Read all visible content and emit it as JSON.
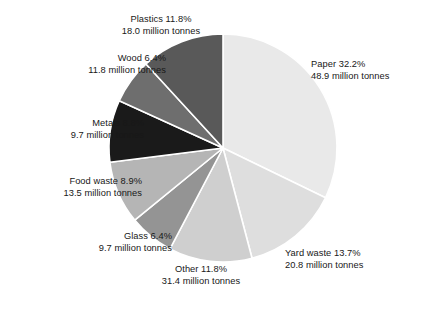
{
  "chart_data": {
    "type": "pie",
    "title": "",
    "subtitle": "",
    "xlabel": "",
    "ylabel": "",
    "units": "million tonnes",
    "legend_position": "none",
    "labels_position": "outside-callout",
    "grid": false,
    "start_angle_deg": 0,
    "direction": "clockwise",
    "center": {
      "x": 223,
      "y": 148
    },
    "radius": 114,
    "categories": [
      "Paper",
      "Yard waste",
      "Other",
      "Glass",
      "Food waste",
      "Metals",
      "Wood",
      "Plastics"
    ],
    "values": [
      32.2,
      13.7,
      11.8,
      6.4,
      8.9,
      8.8,
      6.4,
      11.8
    ],
    "value_unit": "percent",
    "absolute_values": [
      48.9,
      20.8,
      31.4,
      9.7,
      13.5,
      9.7,
      11.8,
      18.0
    ],
    "colors": [
      "#e9e9e9",
      "#dedede",
      "#cfcfcf",
      "#949494",
      "#b5b5b5",
      "#1a1a1a",
      "#6e6e6e",
      "#595959"
    ],
    "slices": [
      {
        "key": "paper",
        "name": "Paper",
        "percent": "32.2%",
        "label_line_1": "Paper 32.2%",
        "label_line_2": "48.9 million tonnes",
        "value": 32.2,
        "tonnes": 48.9,
        "color": "#e9e9e9",
        "align": "left"
      },
      {
        "key": "yard-waste",
        "name": "Yard waste",
        "percent": "13.7%",
        "label_line_1": "Yard waste 13.7%",
        "label_line_2": "20.8 million tonnes",
        "value": 13.7,
        "tonnes": 20.8,
        "color": "#dedede",
        "align": "left"
      },
      {
        "key": "other",
        "name": "Other",
        "percent": "11.8%",
        "label_line_1": "Other 11.8%",
        "label_line_2": "31.4 million tonnes",
        "value": 11.8,
        "tonnes": 31.4,
        "color": "#cfcfcf",
        "align": "center"
      },
      {
        "key": "glass",
        "name": "Glass",
        "percent": "6.4%",
        "label_line_1": "Glass 6.4%",
        "label_line_2": "9.7 million tonnes",
        "value": 6.4,
        "tonnes": 9.7,
        "color": "#949494",
        "align": "right"
      },
      {
        "key": "food-waste",
        "name": "Food waste",
        "percent": "8.9%",
        "label_line_1": "Food waste 8.9%",
        "label_line_2": "13.5 million tonnes",
        "value": 8.9,
        "tonnes": 13.5,
        "color": "#b5b5b5",
        "align": "right"
      },
      {
        "key": "metals",
        "name": "Metals",
        "percent": "8.8%",
        "label_line_1": "Metals 8.8%",
        "label_line_2": "9.7 million tonnes",
        "value": 8.8,
        "tonnes": 9.7,
        "color": "#1a1a1a",
        "align": "right"
      },
      {
        "key": "wood",
        "name": "Wood",
        "percent": "6.4%",
        "label_line_1": "Wood 6.4%",
        "label_line_2": "11.8 million tonnes",
        "value": 6.4,
        "tonnes": 11.8,
        "color": "#6e6e6e",
        "align": "right"
      },
      {
        "key": "plastics",
        "name": "Plastics",
        "percent": "11.8%",
        "label_line_1": "Plastics 11.8%",
        "label_line_2": "18.0 million tonnes",
        "value": 11.8,
        "tonnes": 18.0,
        "color": "#595959",
        "align": "center"
      }
    ]
  }
}
